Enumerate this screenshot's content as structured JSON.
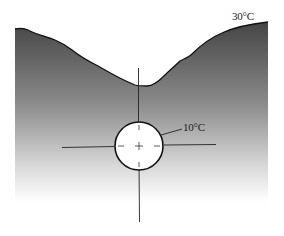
{
  "diagram": {
    "type": "temperature cross-section with central probe",
    "labels": {
      "surface_temp": "30°C",
      "core_temp": "10°C"
    },
    "colors": {
      "surface_fill_top": "#4a4a4a",
      "surface_fill_bottom": "#ffffff",
      "outline": "#111111",
      "circle_fill": "#ffffff"
    }
  }
}
